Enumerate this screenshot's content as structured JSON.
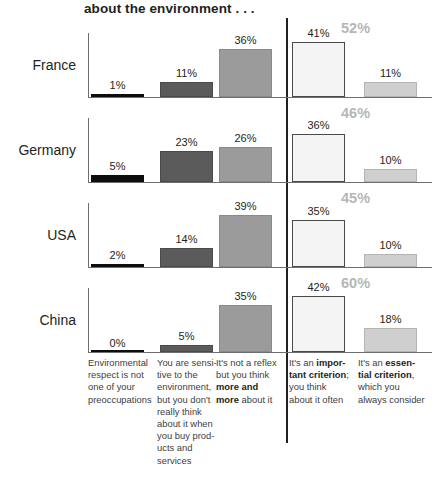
{
  "chart_data": {
    "type": "bar",
    "title": "about the environment . . .",
    "xlabel": "",
    "ylabel": "",
    "ylim": [
      0,
      60
    ],
    "grid": false,
    "legend_position": "bottom-as-category-descriptions",
    "categories": [
      "Environmental respect is not one of your preoccupations",
      "You are sensitive to the environment, but you don't really think about it when you buy products and services",
      "It's not a reflex but you think more and more about it",
      "It's an important criterion; you think about it often",
      "It's an essential criterion, which you always consider"
    ],
    "series": [
      {
        "name": "France",
        "values": [
          1,
          11,
          36,
          41,
          11
        ],
        "total_right": 52
      },
      {
        "name": "Germany",
        "values": [
          5,
          23,
          26,
          36,
          10
        ],
        "total_right": 46
      },
      {
        "name": "USA",
        "values": [
          2,
          14,
          39,
          35,
          10
        ],
        "total_right": 45
      },
      {
        "name": "China",
        "values": [
          0,
          5,
          35,
          42,
          18
        ],
        "total_right": 60
      }
    ],
    "annotations": [
      "Vertical divider separates the first three (low-engagement) categories from the last two (high-engagement) categories",
      "Grey bold percentages at upper right are the sum of the last two categories"
    ],
    "colors": {
      "category_1": "#0d0d0d",
      "category_2": "#5b5b5b",
      "category_3": "#9b9b9b",
      "category_4": "#f4f4f4",
      "category_5": "#cfcfcf",
      "total_label": "#b6b6b6",
      "axis": "#6d6e71",
      "text": "#231f20"
    }
  },
  "title": "about the environment . . .",
  "rows": [
    {
      "country": "France",
      "total": "52%",
      "bars": [
        {
          "label": "1%",
          "value": 1
        },
        {
          "label": "11%",
          "value": 11
        },
        {
          "label": "36%",
          "value": 36
        },
        {
          "label": "41%",
          "value": 41
        },
        {
          "label": "11%",
          "value": 11
        }
      ]
    },
    {
      "country": "Germany",
      "total": "46%",
      "bars": [
        {
          "label": "5%",
          "value": 5
        },
        {
          "label": "23%",
          "value": 23
        },
        {
          "label": "26%",
          "value": 26
        },
        {
          "label": "36%",
          "value": 36
        },
        {
          "label": "10%",
          "value": 10
        }
      ]
    },
    {
      "country": "USA",
      "total": "45%",
      "bars": [
        {
          "label": "2%",
          "value": 2
        },
        {
          "label": "14%",
          "value": 14
        },
        {
          "label": "39%",
          "value": 39
        },
        {
          "label": "35%",
          "value": 35
        },
        {
          "label": "10%",
          "value": 10
        }
      ]
    },
    {
      "country": "China",
      "total": "60%",
      "bars": [
        {
          "label": "0%",
          "value": 0
        },
        {
          "label": "5%",
          "value": 5
        },
        {
          "label": "35%",
          "value": 35
        },
        {
          "label": "42%",
          "value": 42
        },
        {
          "label": "18%",
          "value": 18
        }
      ]
    }
  ],
  "footer": {
    "col1": "Environmental respect is not one of your preoccupations",
    "col2": "You are sensi-tive to the environment, but you don't really think about it when you buy prod-ucts and services",
    "col3_pre": "It's not a reflex but you think ",
    "col3_bold": "more and more",
    "col3_post": " about it",
    "col4_pre": "It's an ",
    "col4_bold": "impor-tant criterion",
    "col4_post": "; you think about it often",
    "col5_pre": "It's an ",
    "col5_bold": "essen-tial criterion",
    "col5_post": ", which you always consider"
  }
}
